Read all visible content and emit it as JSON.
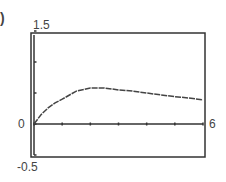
{
  "figure": {
    "part_label": ")"
  },
  "chart_data": {
    "type": "line",
    "title": "",
    "xlabel": "",
    "ylabel": "",
    "xlim": [
      0,
      6
    ],
    "ylim": [
      -0.5,
      1.5
    ],
    "grid": false,
    "legend": null,
    "tick_labels": {
      "y_top": "1.5",
      "y_bottom": "-0.5",
      "y_origin": "0",
      "x_right": "6"
    },
    "x_ticks": [
      0,
      1,
      2,
      3,
      4,
      5,
      6
    ],
    "y_ticks": [
      -0.5,
      0,
      0.5,
      1.0,
      1.5
    ],
    "series": [
      {
        "name": "f(x)",
        "x": [
          0,
          0.25,
          0.5,
          0.75,
          1,
          1.5,
          2,
          2.5,
          3,
          3.5,
          4,
          4.5,
          5,
          5.5,
          6
        ],
        "values": [
          0,
          0.15,
          0.26,
          0.34,
          0.4,
          0.53,
          0.58,
          0.58,
          0.55,
          0.53,
          0.5,
          0.47,
          0.44,
          0.42,
          0.39
        ]
      }
    ]
  }
}
